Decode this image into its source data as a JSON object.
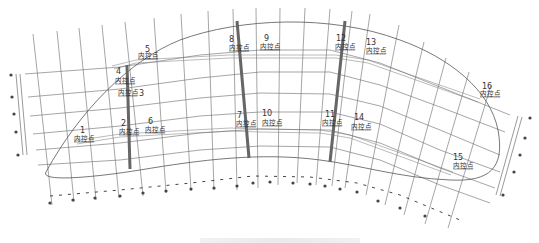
{
  "diagram": {
    "type": "curved-grid-control-point-plan",
    "line_color": "#555555",
    "bar_color": "#666666",
    "label_text": "内控点",
    "control_points": [
      {
        "id": "1",
        "label": "内控点",
        "x": 80,
        "y": 137
      },
      {
        "id": "2",
        "label": "内控点",
        "x": 121,
        "y": 129
      },
      {
        "id": "3",
        "label": "内控点",
        "x": 120,
        "y": 94
      },
      {
        "id": "4",
        "label": "内控点",
        "x": 116,
        "y": 82
      },
      {
        "id": "5",
        "label": "内控点",
        "x": 138,
        "y": 57
      },
      {
        "id": "6",
        "label": "内控点",
        "x": 145,
        "y": 133
      },
      {
        "id": "7",
        "label": "内控点",
        "x": 237,
        "y": 128
      },
      {
        "id": "8",
        "label": "内控点",
        "x": 229,
        "y": 51
      },
      {
        "id": "9",
        "label": "内控点",
        "x": 260,
        "y": 51
      },
      {
        "id": "10",
        "label": "内控点",
        "x": 262,
        "y": 127
      },
      {
        "id": "11",
        "label": "内控点",
        "x": 322,
        "y": 127
      },
      {
        "id": "12",
        "label": "内控点",
        "x": 336,
        "y": 51
      },
      {
        "id": "13",
        "label": "内控点",
        "x": 366,
        "y": 55
      },
      {
        "id": "14",
        "label": "内控点",
        "x": 351,
        "y": 131
      },
      {
        "id": "15",
        "label": "内控点",
        "x": 453,
        "y": 170
      },
      {
        "id": "16",
        "label": "内控点",
        "x": 480,
        "y": 97
      }
    ],
    "thick_bars": [
      {
        "name": "bar-left",
        "x1": 127,
        "y1": 65,
        "x2": 130,
        "y2": 169
      },
      {
        "name": "bar-middle",
        "x1": 237,
        "y1": 21,
        "x2": 249,
        "y2": 158
      },
      {
        "name": "bar-right",
        "x1": 345,
        "y1": 21,
        "x2": 330,
        "y2": 162
      }
    ],
    "caption": ""
  }
}
